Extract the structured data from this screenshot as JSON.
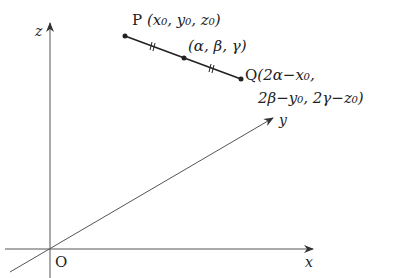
{
  "diagram": {
    "type": "3d-coordinate-midpoint",
    "axes": {
      "z_label": "z",
      "y_label": "y",
      "x_label": "x",
      "origin_label": "O"
    },
    "points": {
      "P": {
        "name": "P",
        "coords": "(x₀, y₀, z₀)"
      },
      "M": {
        "coords": "(α, β, γ)"
      },
      "Q": {
        "name": "Q",
        "coords_line1": "(2α−x₀,",
        "coords_line2": "2β−y₀, 2γ−z₀)"
      }
    },
    "colors": {
      "line": "#222222",
      "axis": "#555555"
    }
  }
}
